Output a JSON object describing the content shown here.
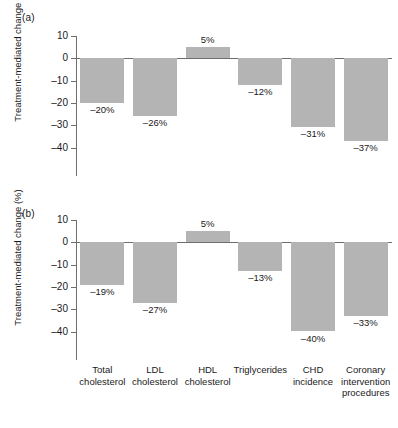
{
  "figure": {
    "panels": [
      {
        "id": "a",
        "label": "(a)"
      },
      {
        "id": "b",
        "label": "(b)"
      }
    ],
    "ylabel": "Treatment-mediated change (%)",
    "bar_color": "#b4b4b4",
    "axis_color": "#6e6e6e",
    "background": "#ffffff"
  },
  "chart_data": [
    {
      "type": "bar",
      "panel": "(a)",
      "title": "",
      "xlabel": "",
      "ylabel": "Treatment-mediated change (%)",
      "categories": [
        "Total cholesterol",
        "LDL cholesterol",
        "HDL cholesterol",
        "Triglycerides",
        "CHD incidence",
        "Coronary intervention procedures"
      ],
      "values": [
        -20,
        -26,
        5,
        -12,
        -31,
        -37
      ],
      "data_labels": [
        "–20%",
        "–26%",
        "5%",
        "–12%",
        "–31%",
        "–37%"
      ],
      "ylim": [
        -40,
        10
      ],
      "yticks": [
        10,
        0,
        -10,
        -20,
        -30,
        -40
      ],
      "ytick_labels": [
        "10",
        "0",
        "–10",
        "–20",
        "–30",
        "–40"
      ],
      "grid": false,
      "legend": "none"
    },
    {
      "type": "bar",
      "panel": "(b)",
      "title": "",
      "xlabel": "",
      "ylabel": "Treatment-mediated change (%)",
      "categories": [
        "Total cholesterol",
        "LDL cholesterol",
        "HDL cholesterol",
        "Triglycerides",
        "CHD incidence",
        "Coronary intervention procedures"
      ],
      "values": [
        -19,
        -27,
        5,
        -13,
        -40,
        -33
      ],
      "data_labels": [
        "–19%",
        "–27%",
        "5%",
        "–13%",
        "–40%",
        "–33%"
      ],
      "ylim": [
        -40,
        10
      ],
      "yticks": [
        10,
        0,
        -10,
        -20,
        -30,
        -40
      ],
      "ytick_labels": [
        "10",
        "0",
        "–10",
        "–20",
        "–30",
        "–40"
      ],
      "grid": false,
      "legend": "none"
    }
  ],
  "categories_display": [
    {
      "line1": "Total",
      "line2": "cholesterol",
      "line3": ""
    },
    {
      "line1": "LDL",
      "line2": "cholesterol",
      "line3": ""
    },
    {
      "line1": "HDL",
      "line2": "cholesterol",
      "line3": ""
    },
    {
      "line1": "Triglycerides",
      "line2": "",
      "line3": ""
    },
    {
      "line1": "CHD",
      "line2": "incidence",
      "line3": ""
    },
    {
      "line1": "Coronary",
      "line2": "intervention",
      "line3": "procedures"
    }
  ]
}
